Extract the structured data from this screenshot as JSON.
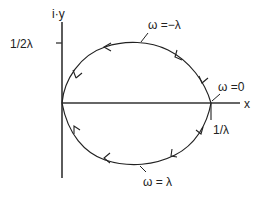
{
  "diagram": {
    "axes": {
      "y_label": "i·y",
      "x_label": "x",
      "y_tick_label": "1/2λ",
      "x_tick_label": "1/λ"
    },
    "curve_labels": {
      "top": "ω =−λ",
      "right": "ω =0",
      "bottom": "ω = λ"
    },
    "colors": {
      "line": "#222222",
      "background": "#ffffff"
    }
  }
}
